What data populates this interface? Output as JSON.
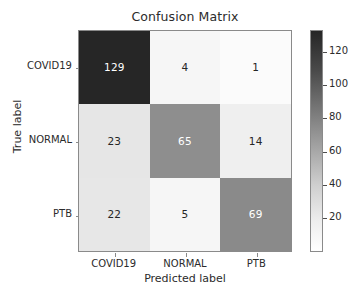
{
  "chart_data": {
    "type": "heatmap",
    "title": "Confusion Matrix",
    "xlabel": "Predicted label",
    "ylabel": "True label",
    "categories": [
      "COVID19",
      "NORMAL",
      "PTB"
    ],
    "row_labels": [
      "COVID19",
      "NORMAL",
      "PTB"
    ],
    "col_labels": [
      "COVID19",
      "NORMAL",
      "PTB"
    ],
    "matrix": [
      [
        129,
        4,
        1
      ],
      [
        23,
        65,
        14
      ],
      [
        22,
        5,
        69
      ]
    ],
    "cells": [
      {
        "row": "COVID19",
        "col": "COVID19",
        "value": 129,
        "fill": "#262626",
        "text_color": "#ffffff"
      },
      {
        "row": "COVID19",
        "col": "NORMAL",
        "value": 4,
        "fill": "#f6f6f6",
        "text_color": "#262626"
      },
      {
        "row": "COVID19",
        "col": "PTB",
        "value": 1,
        "fill": "#fbfbfb",
        "text_color": "#262626"
      },
      {
        "row": "NORMAL",
        "col": "COVID19",
        "value": 23,
        "fill": "#e6e6e6",
        "text_color": "#262626"
      },
      {
        "row": "NORMAL",
        "col": "NORMAL",
        "value": 65,
        "fill": "#8e8e8e",
        "text_color": "#ffffff"
      },
      {
        "row": "NORMAL",
        "col": "PTB",
        "value": 14,
        "fill": "#efefef",
        "text_color": "#262626"
      },
      {
        "row": "PTB",
        "col": "COVID19",
        "value": 22,
        "fill": "#e7e7e7",
        "text_color": "#262626"
      },
      {
        "row": "PTB",
        "col": "NORMAL",
        "value": 5,
        "fill": "#f6f6f6",
        "text_color": "#262626"
      },
      {
        "row": "PTB",
        "col": "PTB",
        "value": 69,
        "fill": "#8a8a8a",
        "text_color": "#ffffff"
      }
    ],
    "colormap": "binary",
    "colorbar": {
      "ticks": [
        20,
        40,
        60,
        80,
        100,
        120
      ],
      "tick_positions_px": [
        218,
        185,
        152,
        118,
        85,
        52
      ],
      "vmin": 1,
      "vmax": 135,
      "position": "right",
      "top_color": "#262626",
      "bottom_color": "#ffffff"
    },
    "grid": false,
    "legend": false
  },
  "axis": {
    "x_tick_labels": [
      "COVID19",
      "NORMAL",
      "PTB"
    ],
    "y_tick_labels": [
      "COVID19",
      "NORMAL",
      "PTB"
    ],
    "x_title": "Predicted label",
    "y_title": "True label"
  },
  "title": "Confusion Matrix"
}
